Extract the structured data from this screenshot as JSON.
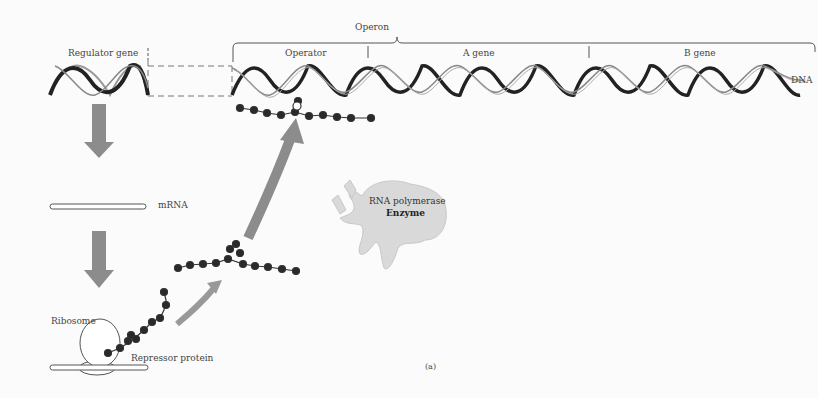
{
  "diagram": {
    "type": "lac-operon-repression",
    "labels": {
      "operon": "Operon",
      "regulator_gene": "Regulator gene",
      "operator": "Operator",
      "a_gene": "A gene",
      "b_gene": "B gene",
      "dna": "DNA",
      "mrna": "mRNA",
      "ribosome": "Ribosome",
      "repressor_protein": "Repressor protein",
      "rna_polymerase": "RNA polymerase",
      "enzyme": "Enzyme",
      "panel": "(a)"
    },
    "colors": {
      "arrow": "#8c8c8c",
      "helix_dark": "#222222",
      "bead": "#2a2a2a",
      "enzyme": "#d6d6d6",
      "background": "#fbfbfb"
    }
  }
}
